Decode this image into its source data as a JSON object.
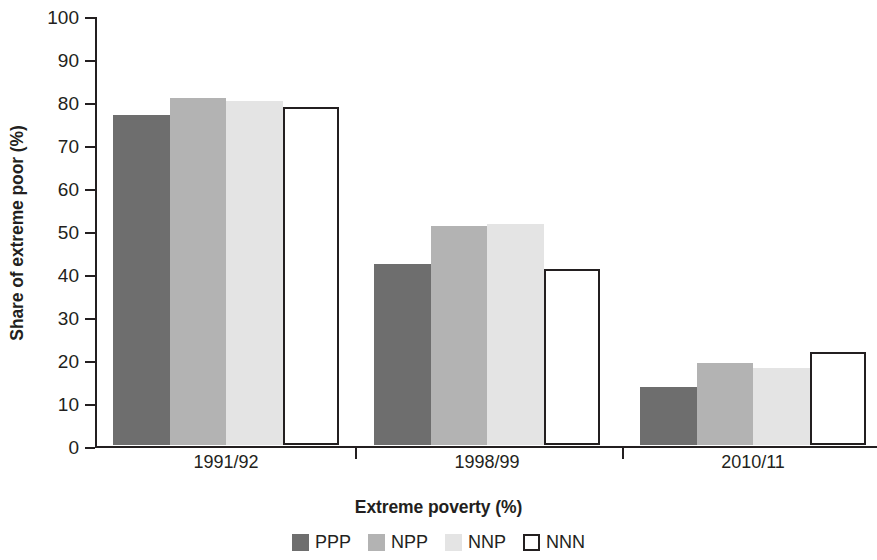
{
  "chart_data": {
    "type": "bar",
    "title": "",
    "xlabel": "Extreme poverty (%)",
    "ylabel": "Share of extreme poor (%)",
    "categories": [
      "1991/92",
      "1998/99",
      "2010/11"
    ],
    "series": [
      {
        "name": "PPP",
        "color": "#6e6e6e",
        "values": [
          76.7,
          42.2,
          13.5
        ]
      },
      {
        "name": "NPP",
        "color": "#b3b3b3",
        "values": [
          80.6,
          51.0,
          19.0
        ]
      },
      {
        "name": "NNP",
        "color": "#e4e4e4",
        "values": [
          80.1,
          51.3,
          17.8
        ]
      },
      {
        "name": "NNN",
        "color": "#ffffff",
        "outlined": true,
        "values": [
          78.5,
          41.0,
          21.6
        ]
      }
    ],
    "ylim": [
      0,
      100
    ],
    "yticks": [
      0,
      10,
      20,
      30,
      40,
      50,
      60,
      70,
      80,
      90,
      100
    ],
    "ytick_labels": [
      "0",
      "10",
      "20",
      "30",
      "40",
      "50",
      "60",
      "70",
      "80",
      "90",
      "100"
    ],
    "grid": false,
    "legend_position": "bottom",
    "legend_entries": [
      "PPP",
      "NPP",
      "NNP",
      "NNN"
    ]
  }
}
